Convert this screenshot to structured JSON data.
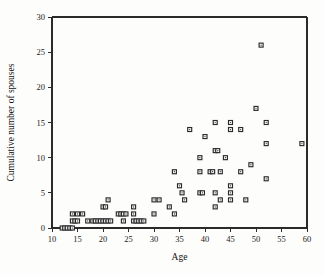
{
  "figure": {
    "background_color": "#fdfdfc",
    "frame_color": "#2b2b2b",
    "marker_color": "#2a2a2a",
    "marker_fill": "#ffffff"
  },
  "chart_data": {
    "type": "scatter",
    "title": "",
    "xlabel": "Age",
    "ylabel": "Cumulative number of spouses",
    "xlim": [
      10,
      60
    ],
    "ylim": [
      0,
      30
    ],
    "xticks": [
      10,
      15,
      20,
      25,
      30,
      35,
      40,
      45,
      50,
      55,
      60
    ],
    "yticks": [
      0,
      5,
      10,
      15,
      20,
      25,
      30
    ],
    "xticklabels": [
      "10",
      "15",
      "20",
      "25",
      "30",
      "35",
      "40",
      "45",
      "50",
      "55",
      "60"
    ],
    "yticklabels": [
      "0",
      "5",
      "10",
      "15",
      "20",
      "25",
      "30"
    ],
    "grid": false,
    "legend": null,
    "marker": "open-square-with-center-dot",
    "points": [
      [
        12,
        0
      ],
      [
        12.5,
        0
      ],
      [
        13,
        0
      ],
      [
        13.5,
        0
      ],
      [
        14,
        0
      ],
      [
        14,
        1
      ],
      [
        14.5,
        1
      ],
      [
        15,
        1
      ],
      [
        14,
        2
      ],
      [
        15,
        2
      ],
      [
        16,
        2
      ],
      [
        17,
        1
      ],
      [
        18,
        1
      ],
      [
        18.5,
        1
      ],
      [
        19,
        1
      ],
      [
        19.5,
        1
      ],
      [
        20,
        1
      ],
      [
        20.5,
        1
      ],
      [
        21,
        1
      ],
      [
        21.5,
        1
      ],
      [
        20,
        3
      ],
      [
        20.5,
        3
      ],
      [
        21,
        4
      ],
      [
        23,
        2
      ],
      [
        23.5,
        2
      ],
      [
        24,
        2
      ],
      [
        24.5,
        2
      ],
      [
        24,
        1
      ],
      [
        26,
        2
      ],
      [
        26,
        3
      ],
      [
        26,
        1
      ],
      [
        26.5,
        1
      ],
      [
        27,
        1
      ],
      [
        27.5,
        1
      ],
      [
        28,
        1
      ],
      [
        30,
        2
      ],
      [
        30,
        4
      ],
      [
        31,
        4
      ],
      [
        33,
        3
      ],
      [
        34,
        2
      ],
      [
        34,
        8
      ],
      [
        35,
        6
      ],
      [
        35.5,
        5
      ],
      [
        36,
        4
      ],
      [
        37,
        14
      ],
      [
        39,
        10
      ],
      [
        39,
        8
      ],
      [
        39,
        5
      ],
      [
        39.5,
        5
      ],
      [
        40,
        13
      ],
      [
        41,
        8
      ],
      [
        41.5,
        8
      ],
      [
        42,
        15
      ],
      [
        42,
        11
      ],
      [
        42.5,
        11
      ],
      [
        42,
        5
      ],
      [
        42,
        3
      ],
      [
        43,
        8
      ],
      [
        43,
        4
      ],
      [
        44,
        10
      ],
      [
        45,
        15
      ],
      [
        45,
        14
      ],
      [
        45,
        6
      ],
      [
        45,
        5
      ],
      [
        45,
        4
      ],
      [
        47,
        14
      ],
      [
        47,
        8
      ],
      [
        48,
        4
      ],
      [
        49,
        9
      ],
      [
        50,
        17
      ],
      [
        51,
        26
      ],
      [
        52,
        15
      ],
      [
        52,
        12
      ],
      [
        52,
        7
      ],
      [
        59,
        12
      ]
    ]
  }
}
